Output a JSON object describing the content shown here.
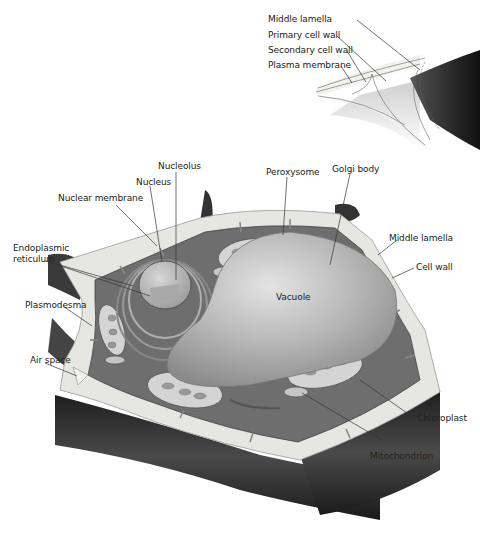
{
  "diagram": {
    "inset": {
      "labels": {
        "middle_lamella": "Middle lamella",
        "primary_cell_wall": "Primary cell wall",
        "secondary_cell_wall": "Secondary cell wall",
        "plasma_membrane": "Plasma membrane"
      }
    },
    "labels": {
      "nucleolus": "Nucleolus",
      "nucleus": "Nucleus",
      "nuclear_membrane": "Nuclear membrane",
      "endoplasmic_reticulum": "Endoplasmic",
      "endoplasmic_reticulum_2": "reticulum",
      "plasmodesma": "Plasmodesma",
      "air_space": "Air space",
      "peroxysome": "Peroxysome",
      "golgi_body": "Golgi body",
      "middle_lamella": "Middle lamella",
      "cell_wall": "Cell wall",
      "vacuole": "Vacuole",
      "chloroplast": "Chloroplast",
      "mitochondrion": "Mitochondrion"
    },
    "colors": {
      "background": "#ffffff",
      "cytoplasm": "#6e6e6e",
      "wall": "#e6e6e2",
      "neighbor_cell": "#2e2e2e",
      "vacuole": "#b9b9b9",
      "organelle": "#c8c8c8",
      "label_line": "#333333"
    }
  }
}
